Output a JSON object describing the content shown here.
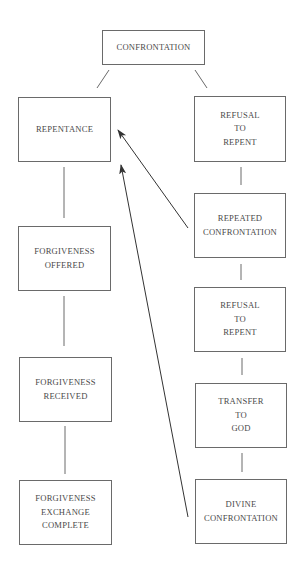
{
  "diagram": {
    "type": "flowchart",
    "colors": {
      "line": "#6a6a6a",
      "text": "#4a4a4a",
      "arrow": "#333333",
      "background": "#ffffff"
    },
    "nodes": [
      {
        "id": "confrontation",
        "lines": [
          "CONFRONTATION"
        ],
        "x": 102,
        "y": 30,
        "w": 103,
        "h": 35
      },
      {
        "id": "repentance",
        "lines": [
          "REPENTANCE"
        ],
        "x": 18,
        "y": 97,
        "w": 93,
        "h": 65
      },
      {
        "id": "refusal-to-repent-1",
        "lines": [
          "REFUSAL",
          "TO",
          "REPENT"
        ],
        "x": 194,
        "y": 96,
        "w": 92,
        "h": 66
      },
      {
        "id": "repeated-confrontation",
        "lines": [
          "REPEATED",
          "CONFRONTATION"
        ],
        "x": 194,
        "y": 193,
        "w": 92,
        "h": 65
      },
      {
        "id": "forgiveness-offered",
        "lines": [
          "FORGIVENESS",
          "OFFERED"
        ],
        "x": 18,
        "y": 226,
        "w": 93,
        "h": 65
      },
      {
        "id": "refusal-to-repent-2",
        "lines": [
          "REFUSAL",
          "TO",
          "REPENT"
        ],
        "x": 194,
        "y": 287,
        "w": 92,
        "h": 65
      },
      {
        "id": "forgiveness-received",
        "lines": [
          "FORGIVENESS",
          "RECEIVED"
        ],
        "x": 19,
        "y": 357,
        "w": 93,
        "h": 65
      },
      {
        "id": "transfer-to-god",
        "lines": [
          "TRANSFER",
          "TO",
          "GOD"
        ],
        "x": 195,
        "y": 383,
        "w": 92,
        "h": 65
      },
      {
        "id": "forgiveness-exchange-complete",
        "lines": [
          "FORGIVENESS",
          "EXCHANGE",
          "COMPLETE"
        ],
        "x": 19,
        "y": 480,
        "w": 93,
        "h": 65
      },
      {
        "id": "divine-confrontation",
        "lines": [
          "DIVINE",
          "CONFRONTATION"
        ],
        "x": 195,
        "y": 479,
        "w": 92,
        "h": 65
      }
    ],
    "edges": [
      {
        "from": "confrontation",
        "to": "repentance",
        "x1": 109,
        "y1": 70,
        "x2": 97,
        "y2": 88,
        "arrow": false
      },
      {
        "from": "confrontation",
        "to": "refusal-to-repent-1",
        "x1": 195,
        "y1": 70,
        "x2": 207,
        "y2": 88,
        "arrow": false
      },
      {
        "from": "repentance",
        "to": "forgiveness-offered",
        "x1": 64,
        "y1": 167,
        "x2": 64,
        "y2": 218,
        "arrow": false
      },
      {
        "from": "forgiveness-offered",
        "to": "forgiveness-received",
        "x1": 64,
        "y1": 296,
        "x2": 64,
        "y2": 346,
        "arrow": false
      },
      {
        "from": "forgiveness-received",
        "to": "forgiveness-exchange-complete",
        "x1": 65,
        "y1": 426,
        "x2": 65,
        "y2": 474,
        "arrow": false
      },
      {
        "from": "refusal-to-repent-1",
        "to": "repeated-confrontation",
        "x1": 241,
        "y1": 167,
        "x2": 241,
        "y2": 185,
        "arrow": false
      },
      {
        "from": "repeated-confrontation",
        "to": "refusal-to-repent-2",
        "x1": 241,
        "y1": 264,
        "x2": 241,
        "y2": 280,
        "arrow": false
      },
      {
        "from": "refusal-to-repent-2",
        "to": "transfer-to-god",
        "x1": 242,
        "y1": 358,
        "x2": 242,
        "y2": 375,
        "arrow": false
      },
      {
        "from": "transfer-to-god",
        "to": "divine-confrontation",
        "x1": 242,
        "y1": 453,
        "x2": 242,
        "y2": 472,
        "arrow": false
      },
      {
        "from": "repeated-confrontation",
        "to": "repentance",
        "x1": 188,
        "y1": 228,
        "x2": 118,
        "y2": 130,
        "arrow": true
      },
      {
        "from": "divine-confrontation",
        "to": "repentance",
        "x1": 188,
        "y1": 517,
        "x2": 121,
        "y2": 165,
        "arrow": true
      }
    ]
  }
}
